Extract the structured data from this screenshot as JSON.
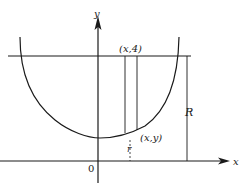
{
  "diagram": {
    "axes": {
      "x_label": "x",
      "y_label": "y",
      "origin_label": "0"
    },
    "labels": {
      "top_point": "(x,4)",
      "curve_point": "(x,y)",
      "small_radius": "r",
      "large_radius": "R"
    },
    "elements": {
      "curve": "U-shaped curve symmetric about y-axis",
      "horizontal_line": "line y = 4",
      "strip": "vertical strip from curve to line y = 4",
      "radius_R": "vertical segment from x-axis to line y = 4",
      "radius_r": "vertical segment from x-axis to curve"
    },
    "colors": {
      "stroke": "#1a1a1a",
      "background": "#ffffff"
    }
  }
}
